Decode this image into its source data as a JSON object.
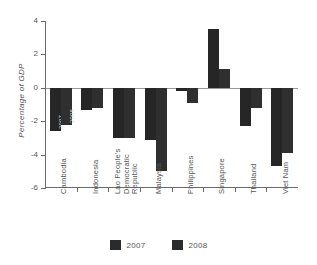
{
  "chart_data": {
    "type": "bar",
    "title": "",
    "subtitle": "",
    "xlabel": "",
    "ylabel": "Percentage of GDP",
    "ylim": [
      -6,
      4
    ],
    "yticks": [
      4,
      2,
      0,
      -2,
      -4,
      -6
    ],
    "ytick_labels": [
      "4",
      "2",
      "0",
      "-2",
      "-4",
      "-6"
    ],
    "grid": false,
    "legend_position": "bottom",
    "categories": [
      "Cambodia",
      "Indonesia",
      "Lao People's Democratic Republic",
      "Malaysia",
      "Philippines",
      "Singapore",
      "Thailand",
      "Viet Nam"
    ],
    "category_lines": [
      [
        "Cambodia"
      ],
      [
        "Indonesia"
      ],
      [
        "Lao People's",
        "Democratic",
        "Republic"
      ],
      [
        "Malaysia"
      ],
      [
        "Philippines"
      ],
      [
        "Singapore"
      ],
      [
        "Thailand"
      ],
      [
        "Viet Nam"
      ]
    ],
    "series": [
      {
        "name": "2007",
        "color": "#262626",
        "values": [
          -2.6,
          -1.3,
          -3.0,
          -3.1,
          -0.2,
          3.5,
          -2.3,
          -4.7
        ]
      },
      {
        "name": "2008",
        "color": "#2f2f2f",
        "values": [
          -2.2,
          -1.2,
          -3.0,
          -5.0,
          -0.9,
          1.1,
          -1.2,
          -3.9
        ]
      }
    ],
    "annotations": [
      {
        "text": "2007",
        "category": "Cambodia",
        "series": "2007"
      },
      {
        "text": "2008",
        "category": "Cambodia",
        "series": "2008"
      }
    ]
  },
  "legend": {
    "items": [
      {
        "label": "2007",
        "color": "#2b2b2b"
      },
      {
        "label": "2008",
        "color": "#2b2b2b"
      }
    ]
  },
  "artifacts": {
    "top_partial_text": ""
  }
}
